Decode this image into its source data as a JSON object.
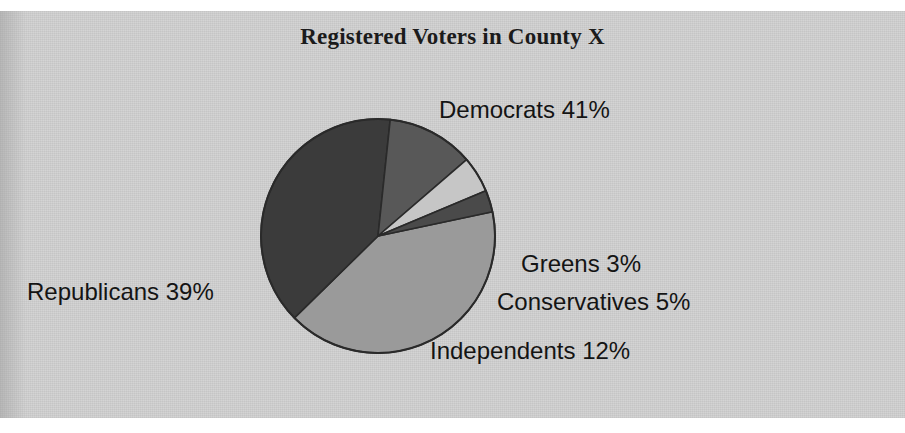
{
  "figure": {
    "background_color": "#ffffff",
    "panel_color": "#d2d2d2"
  },
  "chart_data": {
    "type": "pie",
    "title": "Registered Voters in County X",
    "subtitle": "",
    "xlabel": "",
    "ylabel": "",
    "legend_position": "none",
    "grid": false,
    "labels_inline": true,
    "categories": [
      "Democrats",
      "Republicans",
      "Independents",
      "Conservatives",
      "Greens"
    ],
    "values": [
      41,
      39,
      12,
      5,
      3
    ],
    "unit": "%",
    "total": 100,
    "slices": [
      {
        "name": "Democrats",
        "value": 41,
        "label": "Democrats 41%",
        "color": "#9a9a9a",
        "start_angle_deg": 348,
        "sweep_deg": 147.6
      },
      {
        "name": "Republicans",
        "value": 39,
        "label": "Republicans 39%",
        "color": "#3b3b3b",
        "start_angle_deg": 135.6,
        "sweep_deg": 140.4
      },
      {
        "name": "Independents",
        "value": 12,
        "label": "Independents 12%",
        "color": "#585858",
        "start_angle_deg": 276,
        "sweep_deg": 43.2
      },
      {
        "name": "Conservatives",
        "value": 5,
        "label": "Conservatives 5%",
        "color": "#c6c6c6",
        "start_angle_deg": 319.2,
        "sweep_deg": 18
      },
      {
        "name": "Greens",
        "value": 3,
        "label": "Greens 3%",
        "color": "#4a4a4a",
        "start_angle_deg": 337.2,
        "sweep_deg": 10.8
      }
    ],
    "outline_color": "#2a2a2a",
    "center": {
      "x": 378,
      "y": 236
    },
    "radius": 117
  }
}
